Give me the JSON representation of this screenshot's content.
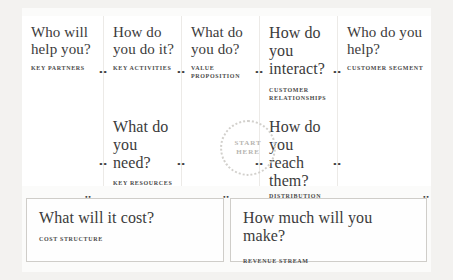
{
  "canvas": {
    "title": "Business Model Canvas",
    "start_marker": {
      "line1": "Start",
      "line2": "Here"
    },
    "top_row": [
      {
        "question": "Who will help you?",
        "label": "Key Partners"
      },
      {
        "question": "How do you do it?",
        "label": "Key Activities"
      },
      {
        "question": "What do you do?",
        "label": "Value Proposition"
      },
      {
        "question": "How do you interact?",
        "label": "Customer Relationships"
      },
      {
        "question": "Who do you help?",
        "label": "Customer Segment"
      }
    ],
    "middle_row": [
      {
        "question": "What do you need?",
        "label": "Key Resources"
      },
      {
        "question": "How do you reach them?",
        "label": "Distribution Channels"
      }
    ],
    "bottom_row": [
      {
        "question": "What will it cost?",
        "label": "Cost Structure"
      },
      {
        "question": "How much will you make?",
        "label": "Revenue Stream"
      }
    ],
    "connector_glyph": "••"
  }
}
